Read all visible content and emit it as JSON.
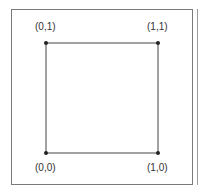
{
  "diagram": {
    "type": "unit-square",
    "vertices": [
      {
        "label": "(0,1)",
        "x": 0,
        "y": 1
      },
      {
        "label": "(1,1)",
        "x": 1,
        "y": 1
      },
      {
        "label": "(0,0)",
        "x": 0,
        "y": 0
      },
      {
        "label": "(1,0)",
        "x": 1,
        "y": 0
      }
    ],
    "colors": {
      "line": "#333333",
      "frame": "#7a7a7a",
      "text": "#333333"
    }
  }
}
